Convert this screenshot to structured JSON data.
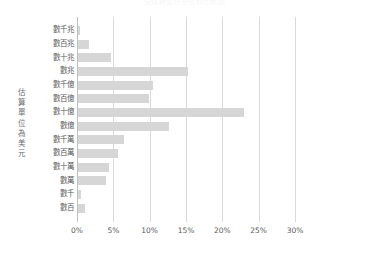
{
  "chart_data": {
    "type": "bar",
    "orientation": "horizontal",
    "title": "全球財富分布估算比例圖",
    "xlabel": "",
    "ylabel": "估算單位為美元",
    "categories": [
      "數千兆",
      "數百兆",
      "數十兆",
      "數兆",
      "數千億",
      "數百億",
      "數十億",
      "數億",
      "數千萬",
      "數百萬",
      "數十萬",
      "數萬",
      "數千",
      "數百"
    ],
    "values": [
      0.3,
      1.5,
      4.5,
      15.2,
      10.3,
      9.8,
      22.8,
      12.5,
      6.3,
      5.5,
      4.3,
      3.8,
      0.4,
      0.9
    ],
    "xlim": [
      0,
      30
    ],
    "xticks": [
      0,
      5,
      10,
      15,
      20,
      25,
      30
    ],
    "xtick_labels": [
      "0%",
      "5%",
      "10%",
      "15%",
      "20%",
      "25%",
      "30%"
    ],
    "grid": true,
    "legend": false,
    "bar_color": "#d6d6d6",
    "gridline_color": "#d9d9d9",
    "axis_color": "#bfbfbf",
    "text_color": "#5a5a5a"
  },
  "axis_title_chars": [
    "估",
    "算",
    "單",
    "位",
    "為",
    "美",
    "元"
  ]
}
